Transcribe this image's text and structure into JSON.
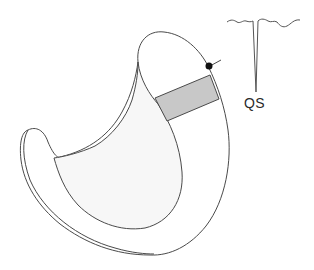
{
  "diagram": {
    "colors": {
      "background": "#ffffff",
      "outline": "#4a4a4a",
      "cavity_fill": "#f7f7f7",
      "region_fill": "#c8c8c8",
      "electrode": "#111111",
      "trace": "#555555"
    },
    "ecg": {
      "label": "QS",
      "complex_type": "QS"
    },
    "electrode": {
      "type": "dot",
      "has_lead_line": true
    },
    "region": {
      "shape": "band",
      "shading": "gray"
    }
  }
}
